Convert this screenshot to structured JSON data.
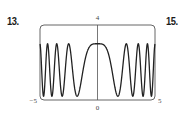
{
  "exercise_labels": [
    "13.",
    "15."
  ],
  "chart_data": {
    "type": "line",
    "title": "",
    "xlabel": "",
    "ylabel": "",
    "xlim": [
      -5,
      5
    ],
    "ylim": [
      0,
      4
    ],
    "grid": false,
    "legend": "none",
    "tick_labels": {
      "x_min": "−5",
      "x_max": "5",
      "x_origin": "0",
      "y_max": "4"
    },
    "function_approx": "y ≈ 1.6 + 1.4·cos(x²)",
    "series": [
      {
        "name": "curve",
        "x": [
          -5,
          -4.75,
          -4.5,
          -4.34,
          -4.2,
          -4.0,
          -3.96,
          -3.8,
          -3.54,
          -3.3,
          -3.07,
          -2.85,
          -2.51,
          -2.2,
          -1.77,
          -1.4,
          -1.0,
          -0.5,
          0,
          0.5,
          1.0,
          1.4,
          1.77,
          2.2,
          2.51,
          2.85,
          3.07,
          3.3,
          3.54,
          3.8,
          3.96,
          4.0,
          4.2,
          4.34,
          4.5,
          4.75,
          5
        ],
        "y": [
          3.0,
          0.25,
          1.0,
          3.0,
          1.6,
          0.25,
          0.2,
          1.7,
          3.0,
          1.0,
          0.2,
          1.3,
          3.0,
          1.6,
          0.2,
          1.0,
          2.36,
          2.97,
          3.0,
          2.97,
          2.36,
          1.0,
          0.2,
          1.6,
          3.0,
          1.3,
          0.2,
          1.0,
          3.0,
          1.7,
          0.2,
          0.25,
          1.6,
          3.0,
          1.0,
          0.25,
          3.0
        ]
      }
    ]
  },
  "colors": {
    "curve": "#222222",
    "frame": "#555555",
    "axis": "#555555"
  }
}
